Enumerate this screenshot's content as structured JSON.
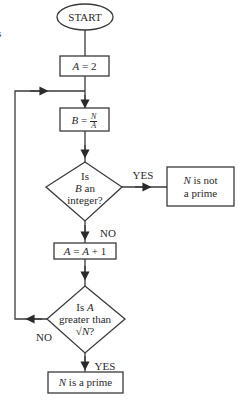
{
  "diagram": {
    "type": "flowchart",
    "edge_fragment": "s",
    "nodes": {
      "start": {
        "shape": "ellipse",
        "label": "START"
      },
      "init": {
        "shape": "rect",
        "var": "A",
        "op": " = ",
        "value": "2"
      },
      "divide": {
        "shape": "rect",
        "var": "B",
        "op": " = ",
        "num": "N",
        "den": "A"
      },
      "check_int": {
        "shape": "diamond",
        "line1": "Is",
        "line2_var": "B",
        "line2_rest": " an",
        "line3": "integer?"
      },
      "not_prime": {
        "shape": "rect",
        "var": "N",
        "line1_rest": " is not",
        "line2": "a prime"
      },
      "increment": {
        "shape": "rect",
        "lhs": "A",
        "op": " = ",
        "rhs_var": "A",
        "rhs_rest": " + 1"
      },
      "check_sqrt": {
        "shape": "diamond",
        "line1_pre": "Is ",
        "line1_var": "A",
        "line2": "greater than",
        "line3_pre": "√",
        "line3_var": "N",
        "line3_post": "?"
      },
      "prime": {
        "shape": "rect",
        "var": "N",
        "rest": " is a prime"
      }
    },
    "edge_labels": {
      "int_yes": "YES",
      "int_no": "NO",
      "sqrt_no": "NO",
      "sqrt_yes": "YES"
    },
    "edges": [
      {
        "from": "start",
        "to": "init"
      },
      {
        "from": "init",
        "to": "divide"
      },
      {
        "from": "divide",
        "to": "check_int"
      },
      {
        "from": "check_int",
        "to": "not_prime",
        "label": "YES"
      },
      {
        "from": "check_int",
        "to": "increment",
        "label": "NO"
      },
      {
        "from": "increment",
        "to": "check_sqrt"
      },
      {
        "from": "check_sqrt",
        "to": "divide",
        "label": "NO"
      },
      {
        "from": "check_sqrt",
        "to": "prime",
        "label": "YES"
      }
    ],
    "colors": {
      "stroke": "#3a3a3a",
      "text": "#2a2a2a",
      "background": "#ffffff"
    }
  }
}
